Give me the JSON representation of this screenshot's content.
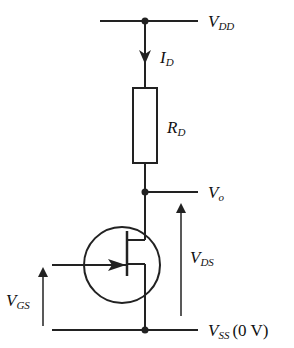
{
  "diagram": {
    "title": "",
    "type": "JFET common-source circuit",
    "colors": {
      "stroke": "#222222",
      "background": "#ffffff"
    },
    "labels": {
      "vdd": {
        "main": "V",
        "sub": "DD"
      },
      "id": {
        "main": "I",
        "sub": "D"
      },
      "rd": {
        "main": "R",
        "sub": "D"
      },
      "vo": {
        "main": "V",
        "sub": "o"
      },
      "vds": {
        "main": "V",
        "sub": "DS"
      },
      "vgs": {
        "main": "V",
        "sub": "GS"
      },
      "vss": {
        "main": "V",
        "sub": "SS",
        "suffix": "(0 V)"
      }
    },
    "components": [
      {
        "id": "rail-vdd",
        "kind": "supply-rail"
      },
      {
        "id": "current-arrow-id",
        "kind": "current-arrow"
      },
      {
        "id": "resistor-rd",
        "kind": "resistor"
      },
      {
        "id": "node-vo",
        "kind": "output-node"
      },
      {
        "id": "jfet",
        "kind": "n-channel-jfet"
      },
      {
        "id": "arrow-vds",
        "kind": "voltage-arrow"
      },
      {
        "id": "arrow-vgs",
        "kind": "voltage-arrow"
      },
      {
        "id": "rail-vss",
        "kind": "supply-rail"
      }
    ]
  }
}
